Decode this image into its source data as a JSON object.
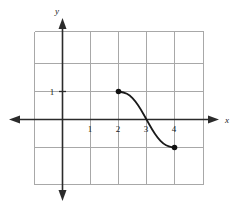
{
  "figure": {
    "title": "",
    "background_color": "#ffffff",
    "grid_color": "#a8a8a8",
    "axis_color": "#2b2b2b",
    "curve_color": "#1a1a1a",
    "point_color": "#111111"
  },
  "axes": {
    "x_label": "x",
    "y_label": "y",
    "x_tick_labels": [
      "1",
      "2",
      "3",
      "4"
    ],
    "y_tick_labels": [
      "1"
    ]
  },
  "chart_data": {
    "type": "line",
    "title": "",
    "xlabel": "x",
    "ylabel": "y",
    "grid": true,
    "legend": null,
    "xlim": [
      -1,
      5
    ],
    "ylim": [
      -2.5,
      3
    ],
    "x_ticks": [
      1,
      2,
      3,
      4
    ],
    "y_ticks": [
      1
    ],
    "x_tick_labels": [
      "1",
      "2",
      "3",
      "4"
    ],
    "y_tick_labels": [
      "1"
    ],
    "grid_spacing": 1,
    "series": [
      {
        "name": "curve",
        "style": "solid",
        "shape": "decreasing-sigmoid",
        "x": [
          2.0,
          2.2,
          2.4,
          2.6,
          2.8,
          3.0,
          3.2,
          3.4,
          3.6,
          3.8,
          4.0
        ],
        "y": [
          1.0,
          0.97,
          0.87,
          0.66,
          0.36,
          0.0,
          -0.36,
          -0.66,
          -0.87,
          -0.97,
          -1.0
        ],
        "endpoints": [
          {
            "x": 2,
            "y": 1,
            "marker": "filled-circle"
          },
          {
            "x": 4,
            "y": -1,
            "marker": "filled-circle"
          }
        ]
      }
    ],
    "annotations": []
  }
}
